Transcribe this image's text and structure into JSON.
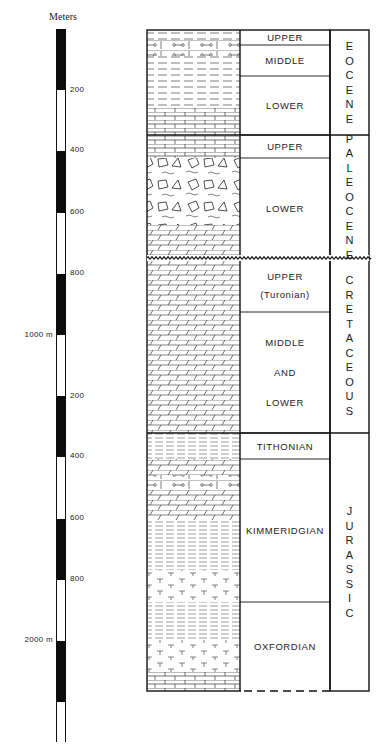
{
  "scale": {
    "title": "Meters",
    "bar_top_px": 29,
    "px_per_200m": 61.2,
    "segments": [
      {
        "from": 0,
        "to": 200,
        "fill": "black"
      },
      {
        "from": 200,
        "to": 400,
        "fill": "white"
      },
      {
        "from": 400,
        "to": 600,
        "fill": "black"
      },
      {
        "from": 600,
        "to": 800,
        "fill": "white"
      },
      {
        "from": 800,
        "to": 1000,
        "fill": "black"
      },
      {
        "from": 1000,
        "to": 1200,
        "fill": "white"
      },
      {
        "from": 1200,
        "to": 1400,
        "fill": "black"
      },
      {
        "from": 1400,
        "to": 1600,
        "fill": "white"
      },
      {
        "from": 1600,
        "to": 1800,
        "fill": "black"
      },
      {
        "from": 1800,
        "to": 2000,
        "fill": "white"
      },
      {
        "from": 2000,
        "to": 2200,
        "fill": "black"
      },
      {
        "from": 2200,
        "to": 2330,
        "fill": "white"
      }
    ],
    "ticks": [
      {
        "label": "200",
        "y": 90,
        "side": "right"
      },
      {
        "label": "400",
        "y": 150,
        "side": "right"
      },
      {
        "label": "600",
        "y": 212,
        "side": "right"
      },
      {
        "label": "800",
        "y": 273,
        "side": "right"
      },
      {
        "label": "1000 m",
        "y": 335,
        "side": "left"
      },
      {
        "label": "200",
        "y": 396,
        "side": "right"
      },
      {
        "label": "400",
        "y": 456,
        "side": "right"
      },
      {
        "label": "600",
        "y": 518,
        "side": "right"
      },
      {
        "label": "800",
        "y": 579,
        "side": "right"
      },
      {
        "label": "2000 m",
        "y": 640,
        "side": "left"
      }
    ]
  },
  "column": {
    "lithology_x": [
      147,
      240
    ],
    "stage_x": [
      240,
      330
    ],
    "system_x": [
      330,
      369
    ],
    "top": 30,
    "bottom": 691,
    "systems": [
      {
        "name": "EOCENE",
        "top": 30,
        "bottom": 135
      },
      {
        "name": "PALEOCENE",
        "top": 135,
        "bottom": 258
      },
      {
        "name": "CRETACEOUS",
        "top": 258,
        "bottom": 433
      },
      {
        "name": "JURASSIC",
        "top": 433,
        "bottom": 691
      }
    ],
    "stages": [
      {
        "label": "UPPER",
        "top": 30,
        "bottom": 45
      },
      {
        "label": "MIDDLE",
        "top": 45,
        "bottom": 76
      },
      {
        "label": "LOWER",
        "top": 76,
        "bottom": 135
      },
      {
        "label": "UPPER",
        "top": 135,
        "bottom": 158
      },
      {
        "label": "LOWER",
        "top": 158,
        "bottom": 258
      },
      {
        "label": "UPPER",
        "label2": "(Turonian)",
        "top": 258,
        "bottom": 312
      },
      {
        "label": "MIDDLE",
        "label2": "AND",
        "label3": "LOWER",
        "top": 312,
        "bottom": 433
      },
      {
        "label": "TITHONIAN",
        "top": 433,
        "bottom": 459
      },
      {
        "label": "KIMMERIDGIAN",
        "top": 459,
        "bottom": 602
      },
      {
        "label": "OXFORDIAN",
        "top": 602,
        "bottom": 691
      }
    ],
    "unconformity_y": 258,
    "bottom_dashed": true
  }
}
